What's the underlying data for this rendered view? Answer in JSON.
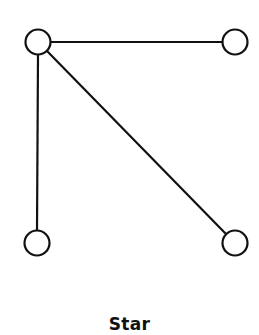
{
  "diagram": {
    "title": "Star",
    "stroke_color": "#111111",
    "node_fill": "#ffffff",
    "node_radius": 13,
    "nodes": [
      {
        "id": "hub",
        "x": 38,
        "y": 42
      },
      {
        "id": "top-right",
        "x": 235,
        "y": 42
      },
      {
        "id": "bottom-left",
        "x": 37,
        "y": 243
      },
      {
        "id": "bottom-right",
        "x": 235,
        "y": 243
      }
    ],
    "edges": [
      {
        "from": "hub",
        "to": "top-right"
      },
      {
        "from": "hub",
        "to": "bottom-left"
      },
      {
        "from": "hub",
        "to": "bottom-right"
      }
    ]
  }
}
